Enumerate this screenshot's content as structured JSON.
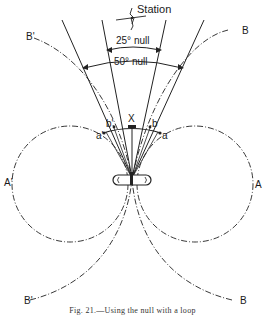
{
  "diagram": {
    "station_label": "Station",
    "null_25_label": "25° null",
    "null_50_label": "50° null",
    "center_label": "X",
    "points": {
      "a_left": "a'",
      "b_left": "b'",
      "b_right": "b",
      "a_right": "a"
    },
    "lobe_labels": {
      "A_left": "A'",
      "A_right": "A",
      "B_upper_left": "B'",
      "B_upper_right": "B",
      "B_lower_left": "B'",
      "B_lower_right": "B"
    },
    "loop_label": "loop antenna",
    "caption": "Fig. 21.—Using the null with a loop"
  },
  "colors": {
    "line": "#222222",
    "background": "#ffffff"
  }
}
